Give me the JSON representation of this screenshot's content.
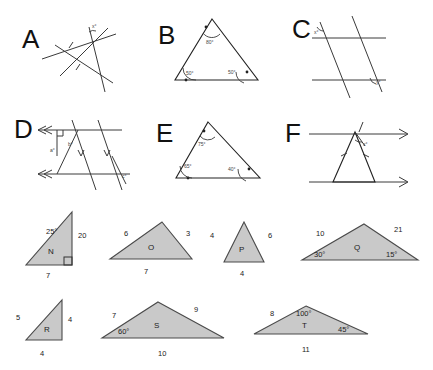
{
  "page": {
    "kind": "geometry-worksheet",
    "background": "#ffffff",
    "shade_color": "#c9c9c9",
    "line_color": "#3a3a3a"
  },
  "diagrams": [
    {
      "id": "A",
      "letter": "A",
      "type": "transversal-triangle",
      "description": "Triangle formed by three intersecting lines with congruence tick marks on two sides and a small angle label at the top vertex",
      "angles": [
        {
          "label": "x°",
          "position": "top-vertex"
        }
      ],
      "tick_marks": 2
    },
    {
      "id": "B",
      "letter": "B",
      "type": "triangle",
      "description": "Triangle with three marked interior angles",
      "angles": [
        {
          "label": "80°",
          "position": "apex"
        },
        {
          "label": "50°",
          "position": "bottom-left"
        },
        {
          "label": "50°",
          "position": "bottom-right"
        }
      ]
    },
    {
      "id": "C",
      "letter": "C",
      "type": "parallel-lines-transversals",
      "description": "Two horizontal parallel lines cut by two parallel transversals with angles marked at upper-left and lower-right intersections",
      "angles": [
        {
          "label": "x°",
          "position": "upper-left"
        },
        {
          "label": "y°",
          "position": "lower-right"
        }
      ]
    },
    {
      "id": "D",
      "letter": "D",
      "type": "parallel-lines-transversals",
      "description": "Two horizontal parallel lines with double arrowheads cut by transversals, a right-angle square, and several marked angles",
      "angles": [
        {
          "label": "a°",
          "position": "left-interior"
        },
        {
          "label": "b°",
          "position": "center-interior"
        },
        {
          "label": "c°",
          "position": "lower-right"
        }
      ],
      "right_angle": true,
      "arrow_marks": 2
    },
    {
      "id": "E",
      "letter": "E",
      "type": "triangle",
      "description": "Scalene triangle with three marked interior angles",
      "angles": [
        {
          "label": "75°",
          "position": "apex"
        },
        {
          "label": "65°",
          "position": "bottom-left"
        },
        {
          "label": "40°",
          "position": "bottom-right"
        }
      ]
    },
    {
      "id": "F",
      "letter": "F",
      "type": "parallel-lines-triangle",
      "description": "Two horizontal parallel lines with single arrowheads enclosing an isosceles triangle with tick marks on the two equal sides",
      "angles": [
        {
          "label": "x°",
          "position": "apex"
        }
      ],
      "tick_marks": 2,
      "arrow_marks": 2
    }
  ],
  "triangles": [
    {
      "id": "N",
      "label": "N",
      "shape": "right-triangle",
      "sides": [
        {
          "value": "7",
          "position": "bottom"
        },
        {
          "value": "20",
          "position": "right"
        }
      ],
      "angles": [
        {
          "value": "25°",
          "position": "top"
        }
      ],
      "right_angle": true,
      "shaded": true
    },
    {
      "id": "O",
      "label": "O",
      "shape": "scalene-triangle",
      "sides": [
        {
          "value": "6",
          "position": "left"
        },
        {
          "value": "3",
          "position": "right"
        },
        {
          "value": "7",
          "position": "bottom"
        }
      ],
      "angles": [],
      "right_angle": false,
      "shaded": true
    },
    {
      "id": "P",
      "label": "P",
      "shape": "isosceles-triangle",
      "sides": [
        {
          "value": "4",
          "position": "left"
        },
        {
          "value": "6",
          "position": "right"
        },
        {
          "value": "4",
          "position": "bottom"
        }
      ],
      "angles": [],
      "right_angle": false,
      "shaded": true
    },
    {
      "id": "Q",
      "label": "Q",
      "shape": "obtuse-triangle",
      "sides": [
        {
          "value": "10",
          "position": "left"
        },
        {
          "value": "21",
          "position": "right"
        }
      ],
      "angles": [
        {
          "value": "30°",
          "position": "bottom-left"
        },
        {
          "value": "15°",
          "position": "bottom-right"
        }
      ],
      "right_angle": false,
      "shaded": true
    },
    {
      "id": "R",
      "label": "R",
      "shape": "right-triangle",
      "sides": [
        {
          "value": "5",
          "position": "left"
        },
        {
          "value": "4",
          "position": "right"
        },
        {
          "value": "4",
          "position": "bottom"
        }
      ],
      "angles": [],
      "right_angle": false,
      "shaded": true
    },
    {
      "id": "S",
      "label": "S",
      "shape": "obtuse-triangle",
      "sides": [
        {
          "value": "7",
          "position": "left"
        },
        {
          "value": "9",
          "position": "right"
        },
        {
          "value": "10",
          "position": "bottom"
        }
      ],
      "angles": [
        {
          "value": "60°",
          "position": "bottom-left"
        }
      ],
      "right_angle": false,
      "shaded": true
    },
    {
      "id": "T",
      "label": "T",
      "shape": "obtuse-triangle",
      "sides": [
        {
          "value": "8",
          "position": "left"
        },
        {
          "value": "11",
          "position": "bottom"
        }
      ],
      "angles": [
        {
          "value": "100°",
          "position": "apex"
        },
        {
          "value": "45°",
          "position": "bottom-right"
        }
      ],
      "right_angle": false,
      "shaded": true
    }
  ]
}
